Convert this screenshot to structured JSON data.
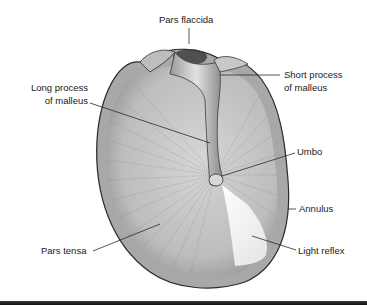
{
  "diagram": {
    "labels": {
      "pars_flaccida": "Pars flaccida",
      "short_process_1": "Short process",
      "short_process_2": "of malleus",
      "long_process_1": "Long process",
      "long_process_2": "of malleus",
      "umbo": "Umbo",
      "annulus": "Annulus",
      "pars_tensa": "Pars tensa",
      "light_reflex": "Light reflex"
    },
    "colors": {
      "membrane": "#c4c4c4",
      "rim": "#9a9a9a",
      "outline": "#2a2a2a",
      "light_reflex": "#f4f4f4",
      "text": "#1a1a1a"
    }
  }
}
